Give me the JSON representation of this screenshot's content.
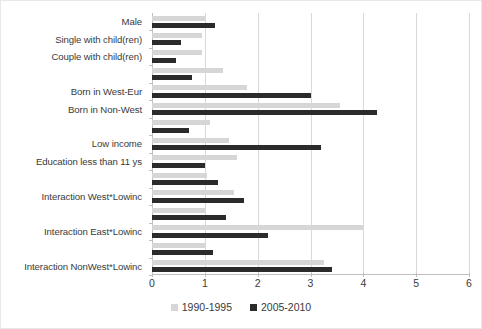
{
  "chart_data": {
    "type": "bar",
    "orientation": "horizontal",
    "title": "",
    "xlabel": "",
    "ylabel": "",
    "xlim": [
      0,
      6
    ],
    "xticks": [
      0,
      1,
      2,
      3,
      4,
      5,
      6
    ],
    "xtick_labels": [
      "0",
      "1",
      "2",
      "3",
      "4",
      "5",
      "6"
    ],
    "grid": true,
    "grid_axis": "x",
    "legend_position": "bottom-center",
    "categories": [
      "Male",
      "Single with child(ren)",
      "Couple with child(ren)",
      "Born in West-Eur",
      "Born in Non-West",
      "Low income",
      "Education less than 11 ys",
      "Interaction West*Lowinc",
      "Interaction East*Lowinc",
      "Interaction NonWest*Lowinc"
    ],
    "series": [
      {
        "name": "1990-1995",
        "color": "#d6d6d6",
        "values": [
          1.0,
          0.95,
          0.95,
          1.8,
          3.55,
          1.45,
          1.6,
          1.55,
          4.0,
          3.25
        ]
      },
      {
        "name": "2005-2010",
        "color": "#2b2b2b",
        "values": [
          1.2,
          0.55,
          0.45,
          3.0,
          4.25,
          3.2,
          1.0,
          1.75,
          2.2,
          3.4
        ]
      }
    ],
    "extra_rows": [
      {
        "label": "",
        "s1990": 1.35,
        "s2005": 0.75
      },
      {
        "label": "",
        "s1990": 1.1,
        "s2005": 0.7
      },
      {
        "label": "",
        "s1990": 1.05,
        "s2005": 1.25
      },
      {
        "label": "",
        "s1990": 1.0,
        "s2005": 1.4
      },
      {
        "label": "",
        "s1990": 1.0,
        "s2005": 1.15
      }
    ]
  },
  "legend": {
    "items": [
      {
        "label": "1990-1995",
        "swatch": "light-gray-swatch"
      },
      {
        "label": "2005-2010",
        "swatch": "dark-swatch"
      }
    ]
  }
}
